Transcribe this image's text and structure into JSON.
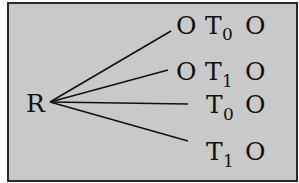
{
  "diagram": {
    "root": {
      "label": "R"
    },
    "branches": [
      {
        "prefix": "O",
        "main": "T",
        "subscript": "0",
        "suffix": "O"
      },
      {
        "prefix": "O",
        "main": "T",
        "subscript": "1",
        "suffix": "O"
      },
      {
        "prefix": "",
        "main": "T",
        "subscript": "0",
        "suffix": "O"
      },
      {
        "prefix": "",
        "main": "T",
        "subscript": "1",
        "suffix": "O"
      }
    ]
  },
  "colors": {
    "background": "#c9c9c9",
    "border": "#2a2a2a",
    "text": "#111111"
  }
}
